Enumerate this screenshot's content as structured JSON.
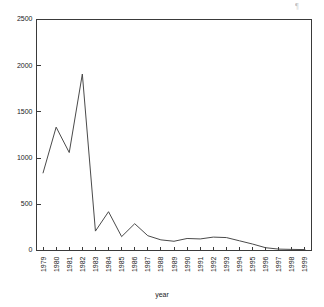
{
  "chart_data": {
    "type": "line",
    "title": "",
    "xlabel": "year",
    "ylabel": "",
    "categories": [
      "1979",
      "1980",
      "1981",
      "1982",
      "1983",
      "1984",
      "1985",
      "1986",
      "1987",
      "1988",
      "1989",
      "1990",
      "1991",
      "1992",
      "1993",
      "1994",
      "1995",
      "1996",
      "1997",
      "1998",
      "1999"
    ],
    "x": [
      1979,
      1980,
      1981,
      1982,
      1983,
      1984,
      1985,
      1986,
      1987,
      1988,
      1989,
      1990,
      1991,
      1992,
      1993,
      1994,
      1995,
      1996,
      1997,
      1998,
      1999
    ],
    "values": [
      840,
      1335,
      1060,
      1910,
      210,
      420,
      150,
      290,
      160,
      115,
      100,
      130,
      125,
      145,
      140,
      105,
      70,
      30,
      15,
      12,
      10
    ],
    "ylim": [
      0,
      2500
    ],
    "yticks": [
      0,
      500,
      1000,
      1500,
      2000,
      2500
    ],
    "ytick_labels": [
      "0",
      "500",
      "1000",
      "1500",
      "2000",
      "2500"
    ],
    "grid": false,
    "legend": null,
    "series": [
      {
        "name": "count",
        "values": [
          840,
          1335,
          1060,
          1910,
          210,
          420,
          150,
          290,
          160,
          115,
          100,
          130,
          125,
          145,
          140,
          105,
          70,
          30,
          15,
          12,
          10
        ]
      }
    ]
  },
  "figure": {
    "corner_mark": "¶",
    "line_color": "#4a4a4a",
    "axis_color": "#3a3a3a",
    "background": "#ffffff"
  }
}
